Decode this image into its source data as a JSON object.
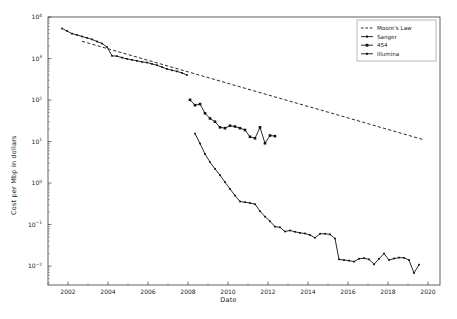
{
  "figure": {
    "title": "",
    "background_color": "#ffffff",
    "line_color": "#111111",
    "frame_color": "#3a3a3a"
  },
  "axes": {
    "xlabel": "Date",
    "ylabel": "Cost per Mbp in dollars",
    "x_ticks": [
      "2002",
      "2004",
      "2006",
      "2008",
      "2010",
      "2012",
      "2014",
      "2016",
      "2018",
      "2020"
    ],
    "y_ticks": [
      "10",
      "10",
      "10",
      "10",
      "10",
      "10",
      "10"
    ],
    "y_tick_exponents": [
      "4",
      "3",
      "2",
      "1",
      "0",
      "−1",
      "−2"
    ]
  },
  "legend": {
    "position": "upper right",
    "entries": [
      {
        "label": "Moore's Law",
        "style": "dashed-line",
        "marker": "none"
      },
      {
        "label": "Sanger",
        "style": "solid-line",
        "marker": "small-square"
      },
      {
        "label": "454",
        "style": "solid-line",
        "marker": "large-square"
      },
      {
        "label": "Illumina",
        "style": "solid-line",
        "marker": "small-square"
      }
    ]
  },
  "chart_data": {
    "type": "line",
    "title": "",
    "xlabel": "Date",
    "ylabel": "Cost per Mbp in dollars",
    "yscale": "log",
    "xlim": [
      2001.0,
      2020.6
    ],
    "ylim": [
      0.0035,
      10000
    ],
    "grid": false,
    "legend_position": "upper right",
    "series": [
      {
        "name": "Moore's Law",
        "style": "dashed",
        "marker": "none",
        "x": [
          2002.7,
          2019.8
        ],
        "y": [
          2600,
          11.0
        ]
      },
      {
        "name": "Sanger",
        "style": "solid",
        "marker": "small-square",
        "x": [
          2001.7,
          2001.95,
          2002.2,
          2002.45,
          2002.7,
          2002.95,
          2003.2,
          2003.45,
          2003.7,
          2003.95,
          2004.2,
          2004.45,
          2004.7,
          2004.95,
          2005.2,
          2005.45,
          2005.7,
          2005.95,
          2006.2,
          2006.45,
          2006.7,
          2006.95,
          2007.2,
          2007.45,
          2007.7,
          2007.95
        ],
        "y": [
          5290,
          4600,
          3970,
          3700,
          3400,
          3150,
          2890,
          2570,
          2300,
          1900,
          1160,
          1140,
          1050,
          980,
          930,
          880,
          830,
          800,
          740,
          690,
          620,
          560,
          520,
          490,
          450,
          400
        ]
      },
      {
        "name": "454",
        "style": "solid",
        "marker": "large-square",
        "x": [
          2008.1,
          2008.35,
          2008.6,
          2008.85,
          2009.1,
          2009.35,
          2009.6,
          2009.85,
          2010.1,
          2010.35,
          2010.6,
          2010.85,
          2011.1,
          2011.35,
          2011.6,
          2011.85,
          2012.1,
          2012.35
        ],
        "y": [
          101,
          75,
          80,
          48,
          36,
          30,
          22,
          21,
          24,
          23,
          21,
          19,
          13,
          12,
          22,
          9.1,
          14,
          13.5
        ]
      },
      {
        "name": "Illumina",
        "style": "solid",
        "marker": "small-square",
        "x": [
          2008.35,
          2008.6,
          2008.85,
          2009.1,
          2009.35,
          2009.6,
          2009.85,
          2010.1,
          2010.35,
          2010.6,
          2010.85,
          2011.1,
          2011.35,
          2011.6,
          2011.85,
          2012.1,
          2012.35,
          2012.6,
          2012.85,
          2013.1,
          2013.35,
          2013.6,
          2013.85,
          2014.1,
          2014.35,
          2014.6,
          2014.85,
          2015.1,
          2015.35,
          2015.55,
          2015.8,
          2016.05,
          2016.3,
          2016.55,
          2016.8,
          2017.05,
          2017.3,
          2017.55,
          2017.8,
          2018.05,
          2018.3,
          2018.55,
          2018.8,
          2019.05,
          2019.3,
          2019.55
        ],
        "y": [
          15.5,
          9.0,
          5.0,
          3.2,
          2.2,
          1.55,
          1.05,
          0.72,
          0.5,
          0.36,
          0.345,
          0.33,
          0.31,
          0.21,
          0.155,
          0.12,
          0.089,
          0.086,
          0.068,
          0.072,
          0.067,
          0.063,
          0.061,
          0.056,
          0.048,
          0.06,
          0.06,
          0.058,
          0.046,
          0.0145,
          0.014,
          0.0135,
          0.0128,
          0.015,
          0.0155,
          0.0145,
          0.011,
          0.015,
          0.02,
          0.014,
          0.0152,
          0.016,
          0.0158,
          0.014,
          0.0068,
          0.0108
        ]
      }
    ]
  }
}
